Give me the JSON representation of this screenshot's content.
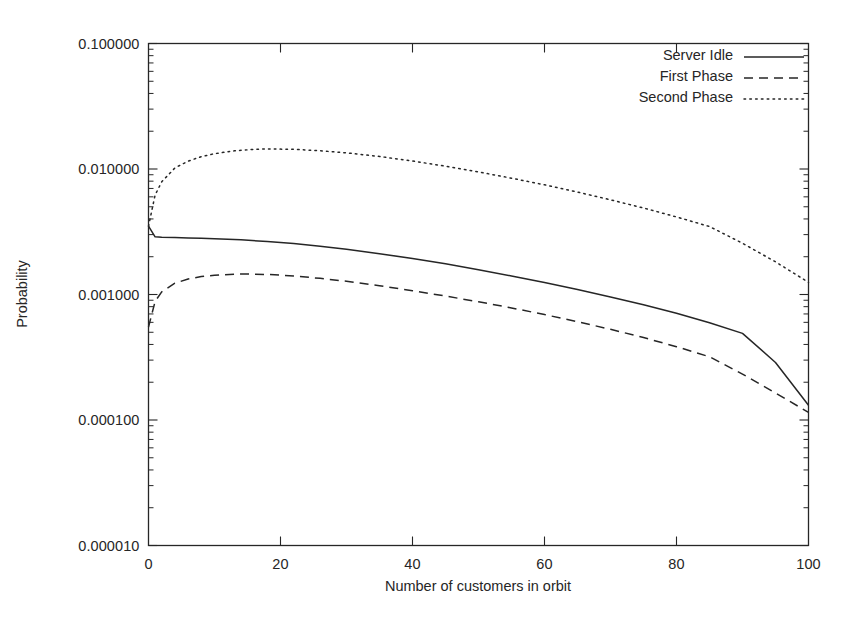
{
  "chart_data": {
    "type": "line",
    "title": "",
    "xlabel": "Number of customers in orbit",
    "ylabel": "Probability",
    "xlim": [
      0,
      100
    ],
    "ylim": [
      1e-05,
      0.1
    ],
    "yscale": "log",
    "grid": false,
    "legend_position": "top-right",
    "xticks": [
      "0",
      "20",
      "40",
      "60",
      "80",
      "100"
    ],
    "xtick_values": [
      0,
      20,
      40,
      60,
      80,
      100
    ],
    "yticks": [
      "0.100000",
      "0.010000",
      "0.001000",
      "0.000100",
      "0.000010"
    ],
    "ytick_values": [
      0.1,
      0.01,
      0.001,
      0.0001,
      1e-05
    ],
    "series": [
      {
        "name": "Server Idle",
        "style": "solid",
        "color": "#262626",
        "x": [
          0,
          1,
          2,
          4,
          6,
          8,
          10,
          14,
          18,
          22,
          26,
          30,
          35,
          40,
          45,
          50,
          55,
          60,
          65,
          70,
          75,
          80,
          85,
          90,
          95,
          100
        ],
        "values": [
          0.0035,
          0.00288,
          0.00286,
          0.002845,
          0.002825,
          0.002805,
          0.002785,
          0.002725,
          0.002645,
          0.002545,
          0.002425,
          0.002295,
          0.002115,
          0.001935,
          0.001755,
          0.001575,
          0.001405,
          0.001245,
          0.001095,
          0.000955,
          0.00083,
          0.00071,
          0.000595,
          0.00049,
          0.0002875,
          0.000131
        ]
      },
      {
        "name": "First Phase",
        "style": "dashed",
        "color": "#262626",
        "x": [
          0,
          1,
          2,
          4,
          6,
          8,
          10,
          13,
          15,
          18,
          22,
          26,
          30,
          35,
          40,
          45,
          50,
          55,
          60,
          65,
          70,
          75,
          80,
          85,
          90,
          95,
          100
        ],
        "values": [
          0.00055,
          0.00088,
          0.00105,
          0.00123,
          0.00133,
          0.00139,
          0.001425,
          0.001452,
          0.001455,
          0.001445,
          0.001405,
          0.001345,
          0.001275,
          0.001175,
          0.001072,
          0.000972,
          0.000875,
          0.000782,
          0.000692,
          0.000607,
          0.000528,
          0.000454,
          0.000384,
          0.000319,
          0.000232,
          0.000164,
          0.000115
        ]
      },
      {
        "name": "Second Phase",
        "style": "dotted",
        "color": "#262626",
        "x": [
          0,
          1,
          2,
          4,
          6,
          8,
          10,
          13,
          16,
          18,
          22,
          26,
          30,
          35,
          40,
          45,
          50,
          55,
          60,
          65,
          70,
          75,
          80,
          85,
          90,
          95,
          100
        ],
        "values": [
          0.0035,
          0.0062,
          0.0079,
          0.0102,
          0.01155,
          0.01255,
          0.01325,
          0.01395,
          0.01435,
          0.01445,
          0.01435,
          0.01398,
          0.01345,
          0.01258,
          0.01158,
          0.01052,
          0.00948,
          0.00845,
          0.00748,
          0.00655,
          0.00568,
          0.00489,
          0.00415,
          0.00348,
          0.00256,
          0.00182,
          0.00125
        ]
      }
    ]
  },
  "axes": {
    "frame_color": "#262626"
  }
}
